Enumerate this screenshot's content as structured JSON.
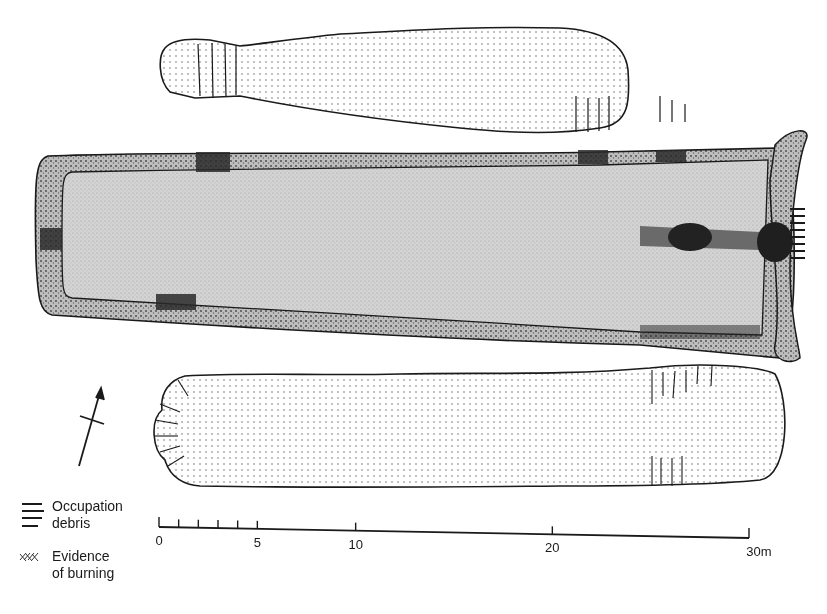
{
  "figure": {
    "features": [
      {
        "id": "north-pit",
        "label": "Pit (north)",
        "fill": "light stipple"
      },
      {
        "id": "central-building",
        "label": "Rectangular building with wall trench",
        "fill": "grey stipple"
      },
      {
        "id": "south-pit",
        "label": "Pit (south)",
        "fill": "light stipple"
      },
      {
        "id": "hearth",
        "label": "Hearth / burnt area",
        "fill": "dark"
      }
    ],
    "north_arrow": {
      "icon": "north-arrow-icon",
      "label": ""
    }
  },
  "legend": {
    "items": [
      {
        "icon": "occupation-debris-icon",
        "lines": [
          "Occupation",
          "debris"
        ]
      },
      {
        "icon": "burning-hatch-icon",
        "lines": [
          "Evidence",
          "of burning"
        ]
      }
    ]
  },
  "scale_bar": {
    "unit": "m",
    "major_ticks": [
      0,
      5,
      10,
      20,
      30
    ],
    "minor_ticks": [
      1,
      2,
      3,
      4
    ],
    "labels": [
      "0",
      "5",
      "10",
      "20",
      "30m"
    ],
    "max": 30
  },
  "colors": {
    "ink": "#1a1a1a",
    "wall_fill": "#a9a9a9",
    "interior_fill": "#d2d2d2",
    "pit_fill": "#ffffff",
    "burnt": "#2a2a2a"
  }
}
